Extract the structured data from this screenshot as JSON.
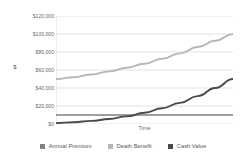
{
  "chart_data": {
    "type": "line",
    "title": "",
    "xlabel": "Time",
    "ylabel": "$",
    "ylim": [
      0,
      120000
    ],
    "xlim": [
      0,
      30
    ],
    "grid": true,
    "legend_position": "bottom",
    "y_ticks": [
      "$120,000",
      "$100,000",
      "$80,000",
      "$60,000",
      "$40,000",
      "$20,000",
      "$0"
    ],
    "y_tick_values": [
      120000,
      100000,
      80000,
      60000,
      40000,
      20000,
      0
    ],
    "x_tick_labels": [],
    "x": [
      0,
      3,
      6,
      9,
      12,
      15,
      18,
      21,
      24,
      27,
      30
    ],
    "series": [
      {
        "name": "Annual Premium",
        "color": "#7f7f82",
        "values": [
          10000,
          10000,
          10000,
          10000,
          10000,
          10000,
          10000,
          10000,
          10000,
          10000,
          10000
        ]
      },
      {
        "name": "Death Benefit",
        "color": "#b7b7ba",
        "values": [
          50000,
          52000,
          55000,
          58500,
          62500,
          67000,
          72500,
          78500,
          85500,
          92500,
          100000
        ]
      },
      {
        "name": "Cash Value",
        "color": "#4a4a4d",
        "values": [
          1000,
          2000,
          3500,
          5500,
          8500,
          12500,
          17500,
          23500,
          31000,
          40000,
          50000
        ]
      }
    ]
  },
  "legend": {
    "items": [
      {
        "label": "Annual Premium",
        "color": "#7f7f82"
      },
      {
        "label": "Death Benefit",
        "color": "#b7b7ba"
      },
      {
        "label": "Cash Value",
        "color": "#4a4a4d"
      }
    ]
  },
  "colors": {
    "background": "#ffffff",
    "gridline": "#d6d6d6",
    "axis_line": "#cfcfcf",
    "tick_text": "#6b6b6d",
    "legend_text": "#58585a"
  }
}
